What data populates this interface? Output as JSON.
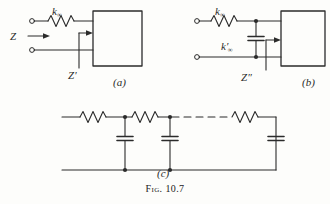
{
  "figure": {
    "caption_prefix": "Fig.",
    "caption_number": "10.7"
  },
  "panels": [
    {
      "id": "a",
      "label": "(a)",
      "elements": {
        "series_resistor_label": "k",
        "series_resistor_subscript": "∞",
        "input_impedance_label": "Z",
        "box_impedance_label": "Z",
        "box_impedance_prime": "′"
      }
    },
    {
      "id": "b",
      "label": "(b)",
      "elements": {
        "series_resistor_label": "k",
        "series_resistor_subscript": "∞",
        "shunt_capacitor_label": "k",
        "shunt_capacitor_prime": "′",
        "shunt_capacitor_subscript": "∞",
        "box_impedance_label": "Z",
        "box_impedance_prime": "″"
      }
    },
    {
      "id": "c",
      "label": "(c)",
      "elements": {
        "description": "ladder network of series resistors and shunt capacitors"
      }
    }
  ],
  "style": {
    "ink_color": "#2b2b2b",
    "paper_color": "#fdfdfb"
  }
}
